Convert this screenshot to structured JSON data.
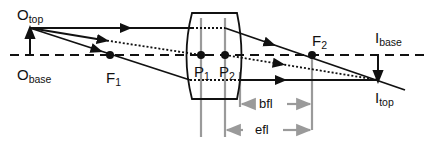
{
  "diagram": {
    "colors": {
      "ray": "#111111",
      "guide": "#9a9a9a",
      "background": "#ffffff"
    },
    "labels": {
      "object_top": {
        "main": "O",
        "sub": "top"
      },
      "object_base": {
        "main": "O",
        "sub": "base"
      },
      "focal_1": {
        "main": "F",
        "sub": "1"
      },
      "focal_2": {
        "main": "F",
        "sub": "2"
      },
      "principal_1": {
        "main": "P",
        "sub": "1"
      },
      "principal_2": {
        "main": "P",
        "sub": "2"
      },
      "image_base": {
        "main": "I",
        "sub": "base"
      },
      "image_top": {
        "main": "I",
        "sub": "top"
      }
    },
    "dimensions": {
      "back_focal_length": "bfl",
      "effective_focal_length": "efl"
    }
  }
}
